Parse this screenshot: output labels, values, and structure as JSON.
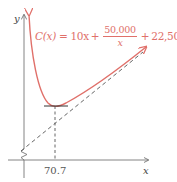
{
  "diagram": {
    "type": "function-graph",
    "axes": {
      "x_label": "x",
      "y_label": "y",
      "y_axis_break": true
    },
    "curve": {
      "color": "#e0706a",
      "formula": {
        "lhs": "C(x)",
        "equals": "=",
        "term1": "10x",
        "plus1": "+",
        "fraction_numerator": "50,000",
        "fraction_denominator": "x",
        "plus2": "+",
        "constant": "22,500"
      }
    },
    "asymptote": {
      "style": "dashed",
      "color": "#555555"
    },
    "minimum": {
      "x_value_label": "70.7",
      "tangent_style": "solid horizontal",
      "drop_line_style": "dashed vertical"
    }
  }
}
